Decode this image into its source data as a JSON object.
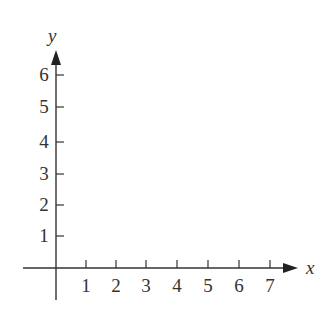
{
  "diagram": {
    "type": "coordinate-plane",
    "x_axis": {
      "label": "x",
      "ticks": [
        "1",
        "2",
        "3",
        "4",
        "5",
        "6",
        "7"
      ]
    },
    "y_axis": {
      "label": "y",
      "ticks": [
        "1",
        "2",
        "3",
        "4",
        "5",
        "6"
      ]
    },
    "colors": {
      "axis": "#333333",
      "background": "#ffffff"
    }
  }
}
